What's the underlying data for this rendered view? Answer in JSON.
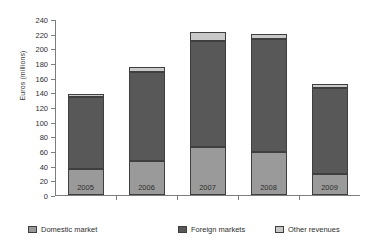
{
  "chart_data": {
    "type": "bar",
    "stacked": true,
    "title": "",
    "xlabel": "",
    "ylabel": "Euros (millions)",
    "ylim": [
      0,
      240
    ],
    "ytick_step": 20,
    "yticks": [
      0,
      20,
      40,
      60,
      80,
      100,
      120,
      140,
      160,
      180,
      200,
      220,
      240
    ],
    "categories": [
      "2005",
      "2006",
      "2007",
      "2008",
      "2009"
    ],
    "grid": false,
    "legend_position": "bottom",
    "series": [
      {
        "name": "Domestic market",
        "color": "#9a9a9a",
        "values": [
          35,
          47,
          65,
          58,
          28
        ]
      },
      {
        "name": "Foreign markets",
        "color": "#585858",
        "values": [
          98,
          121,
          145,
          155,
          118
        ]
      },
      {
        "name": "Other revenues",
        "color": "#c9c9c9",
        "values": [
          5,
          6,
          12,
          6,
          6
        ]
      }
    ],
    "totals": [
      138,
      174,
      222,
      219,
      152
    ]
  },
  "legend": {
    "items": [
      {
        "label": "Domestic market"
      },
      {
        "label": "Foreign markets"
      },
      {
        "label": "Other revenues"
      }
    ]
  }
}
